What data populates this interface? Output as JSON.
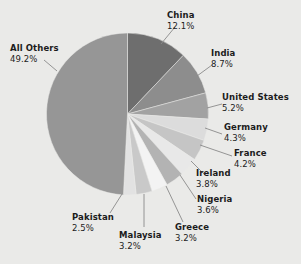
{
  "chart_data": {
    "type": "pie",
    "title": "",
    "subtitle": "",
    "xlabel": "",
    "ylabel": "",
    "legend_position": "none",
    "grid": false,
    "units": "percent",
    "start_angle_deg": 0,
    "direction": "clockwise",
    "categories": [
      "China",
      "India",
      "United States",
      "Germany",
      "France",
      "Ireland",
      "Nigeria",
      "Greece",
      "Malaysia",
      "Pakistan",
      "All Others"
    ],
    "values": [
      12.1,
      8.7,
      5.2,
      4.3,
      4.2,
      3.8,
      3.6,
      3.2,
      3.2,
      2.5,
      49.2
    ],
    "slices": [
      {
        "label": "China",
        "value": 12.1,
        "value_text": "12.1%",
        "color": "#6e6e6e"
      },
      {
        "label": "India",
        "value": 8.7,
        "value_text": "8.7%",
        "color": "#8d8d8d"
      },
      {
        "label": "United States",
        "value": 5.2,
        "value_text": "5.2%",
        "color": "#a2a2a2"
      },
      {
        "label": "Germany",
        "value": 4.3,
        "value_text": "4.3%",
        "color": "#dcdcdc"
      },
      {
        "label": "France",
        "value": 4.2,
        "value_text": "4.2%",
        "color": "#c5c5c5"
      },
      {
        "label": "Ireland",
        "value": 3.8,
        "value_text": "3.8%",
        "color": "#e8e8e8"
      },
      {
        "label": "Nigeria",
        "value": 3.6,
        "value_text": "3.6%",
        "color": "#b3b3b3"
      },
      {
        "label": "Greece",
        "value": 3.2,
        "value_text": "3.2%",
        "color": "#f3f3f3"
      },
      {
        "label": "Malaysia",
        "value": 3.2,
        "value_text": "3.2%",
        "color": "#c9c9c9"
      },
      {
        "label": "Pakistan",
        "value": 2.5,
        "value_text": "2.5%",
        "color": "#e2e2e2"
      },
      {
        "label": "All Others",
        "value": 49.2,
        "value_text": "49.2%",
        "color": "#969696"
      }
    ]
  },
  "labels": {
    "china": {
      "name": "China",
      "value": "12.1%"
    },
    "india": {
      "name": "India",
      "value": "8.7%"
    },
    "united_states": {
      "name": "United States",
      "value": "5.2%"
    },
    "germany": {
      "name": "Germany",
      "value": "4.3%"
    },
    "france": {
      "name": "France",
      "value": "4.2%"
    },
    "ireland": {
      "name": "Ireland",
      "value": "3.8%"
    },
    "nigeria": {
      "name": "Nigeria",
      "value": "3.6%"
    },
    "greece": {
      "name": "Greece",
      "value": "3.2%"
    },
    "malaysia": {
      "name": "Malaysia",
      "value": "3.2%"
    },
    "pakistan": {
      "name": "Pakistan",
      "value": "2.5%"
    },
    "all_others": {
      "name": "All Others",
      "value": "49.2%"
    }
  },
  "style": {
    "background": "#eaeae8",
    "text_color": "#1c1c1c",
    "leader_line_color": "#8a8a8a"
  }
}
